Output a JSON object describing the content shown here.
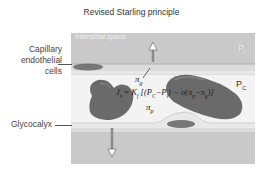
{
  "title": "Revised Starling principle",
  "labels": {
    "capillary_line1": "Capillary",
    "capillary_line2": "endothelial",
    "capillary_line3": "cells",
    "glycocalyx": "Glycocalyx",
    "interstitial_space": "Interstitial space",
    "p_interstitial": "P",
    "p_interstitial_sub": "i",
    "p_capillary": "P",
    "p_capillary_sub": "C",
    "pi_g": "π",
    "pi_g_sub": "g",
    "pi_p": "π",
    "pi_p_sub": "p"
  },
  "equation": {
    "lhs": "J",
    "lhs_sub": "v",
    "eq": " = ",
    "k": "K",
    "k_sub": "f",
    "body_open": " [(P",
    "pc_sub": "C",
    "minus1": "−P",
    "pi_sub": "i",
    "body_mid": ") − σ(π",
    "pip_sub": "p",
    "minus2": "−π",
    "pig_sub": "g",
    "body_close": ")]"
  },
  "colors": {
    "interstitial": "#c9c9c9",
    "lumen": "#f2f2f2",
    "glycocalyx": "#e6e6e6",
    "endothelium": "#dadada",
    "cell_nucleus": "#6e6e6e",
    "red_cell": "#6a6a6a",
    "arrow": "#8a8a8a"
  }
}
